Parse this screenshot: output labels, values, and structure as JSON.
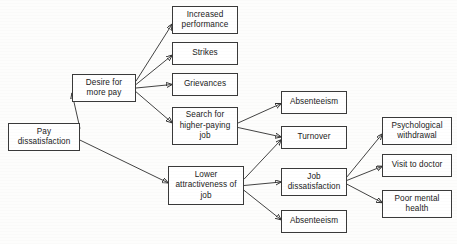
{
  "diagram": {
    "type": "flowchart",
    "line_color": "#2e2e2e",
    "box_border_color": "#3a3a3a",
    "box_fill_color": "#ffffff",
    "nodes": [
      {
        "id": "pay_dissatisfaction",
        "label": "Pay\ndissatisfaction",
        "x": 8,
        "y": 123,
        "w": 72,
        "h": 28
      },
      {
        "id": "desire_more_pay",
        "label": "Desire for\nmore pay",
        "x": 72,
        "y": 74,
        "w": 64,
        "h": 28
      },
      {
        "id": "increased_performance",
        "label": "Increased\nperformance",
        "x": 172,
        "y": 6,
        "w": 66,
        "h": 28
      },
      {
        "id": "strikes",
        "label": "Strikes",
        "x": 172,
        "y": 42,
        "w": 66,
        "h": 23
      },
      {
        "id": "grievances",
        "label": "Grievances",
        "x": 172,
        "y": 73,
        "w": 66,
        "h": 23
      },
      {
        "id": "search_higher_paying",
        "label": "Search for\nhigher-paying\njob",
        "x": 172,
        "y": 107,
        "w": 66,
        "h": 38
      },
      {
        "id": "lower_attractiveness",
        "label": "Lower\nattractiveness of\njob",
        "x": 168,
        "y": 166,
        "w": 76,
        "h": 39
      },
      {
        "id": "absenteeism_top",
        "label": "Absenteeism",
        "x": 281,
        "y": 91,
        "w": 66,
        "h": 23
      },
      {
        "id": "turnover",
        "label": "Turnover",
        "x": 281,
        "y": 126,
        "w": 66,
        "h": 23
      },
      {
        "id": "job_dissatisfaction",
        "label": "Job\ndissatisfaction",
        "x": 281,
        "y": 168,
        "w": 66,
        "h": 28
      },
      {
        "id": "absenteeism_bottom",
        "label": "Absenteeism",
        "x": 281,
        "y": 210,
        "w": 66,
        "h": 23
      },
      {
        "id": "psychological_withdrawal",
        "label": "Psychological\nwithdrawal",
        "x": 382,
        "y": 117,
        "w": 70,
        "h": 28
      },
      {
        "id": "visit_to_doctor",
        "label": "Visit to doctor",
        "x": 382,
        "y": 154,
        "w": 70,
        "h": 23
      },
      {
        "id": "poor_mental_health",
        "label": "Poor mental\nhealth",
        "x": 382,
        "y": 190,
        "w": 70,
        "h": 28
      }
    ],
    "edges": [
      {
        "from": "pay_dissatisfaction",
        "to": "desire_more_pay"
      },
      {
        "from": "pay_dissatisfaction",
        "to": "lower_attractiveness"
      },
      {
        "from": "desire_more_pay",
        "to": "increased_performance"
      },
      {
        "from": "desire_more_pay",
        "to": "strikes"
      },
      {
        "from": "desire_more_pay",
        "to": "grievances"
      },
      {
        "from": "desire_more_pay",
        "to": "search_higher_paying"
      },
      {
        "from": "search_higher_paying",
        "to": "absenteeism_top"
      },
      {
        "from": "search_higher_paying",
        "to": "turnover"
      },
      {
        "from": "lower_attractiveness",
        "to": "turnover"
      },
      {
        "from": "lower_attractiveness",
        "to": "job_dissatisfaction"
      },
      {
        "from": "lower_attractiveness",
        "to": "absenteeism_bottom"
      },
      {
        "from": "job_dissatisfaction",
        "to": "psychological_withdrawal"
      },
      {
        "from": "job_dissatisfaction",
        "to": "visit_to_doctor"
      },
      {
        "from": "job_dissatisfaction",
        "to": "poor_mental_health"
      }
    ]
  }
}
